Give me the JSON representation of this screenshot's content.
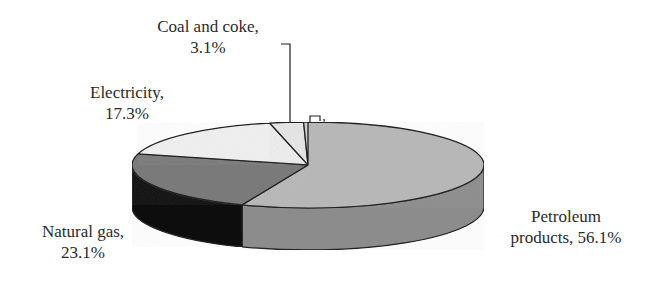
{
  "chart_data": {
    "type": "pie",
    "style": "3d-pie",
    "title": "",
    "categories": [
      "Petroleum products",
      "Natural gas",
      "Electricity",
      "Coal and coke",
      ""
    ],
    "values": [
      56.1,
      23.1,
      17.3,
      3.1,
      0.4
    ],
    "labels": [
      {
        "name": "Petroleum products",
        "value": "56.1%",
        "line1": "Petroleum",
        "line2": "products, 56.1%"
      },
      {
        "name": "Natural gas",
        "value": "23.1%",
        "line1": "Natural gas,",
        "line2": "23.1%"
      },
      {
        "name": "Electricity",
        "value": "17.3%",
        "line1": "Electricity,",
        "line2": "17.3%"
      },
      {
        "name": "Coal and coke",
        "value": "3.1%",
        "line1": "Coal and coke,",
        "line2": "3.1%"
      },
      {
        "name": "",
        "value": "",
        "line1": ",",
        "line2": ""
      }
    ],
    "colors": {
      "Petroleum products": "#b9b9b9",
      "Natural gas": "#7c7c7c",
      "Electricity": "#f0f0f0",
      "Coal and coke": "#e6e6e6",
      "unlabeled": "#cfcfcf"
    },
    "side_colors": {
      "Petroleum products": "#8e8e8e",
      "Natural gas": "#111111"
    },
    "legend": "none",
    "grid": false
  }
}
